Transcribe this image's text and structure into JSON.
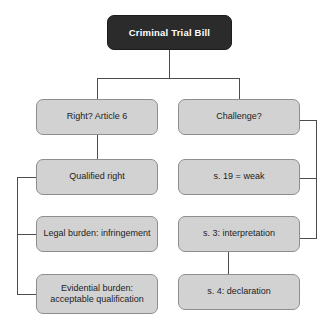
{
  "diagram": {
    "title": "Criminal Trial Bill",
    "type": "flowchart",
    "orientation": "top-down",
    "colors": {
      "root_fill": "#2b2b2b",
      "root_text": "#ffffff",
      "node_fill": "#d2d2d2",
      "node_border": "#8e8e8e",
      "node_text": "#1d1d1d",
      "connector": "#4d4d4d",
      "background": "#ffffff"
    },
    "nodes": {
      "root": {
        "label": "Criminal Trial Bill"
      },
      "left_1": {
        "label": "Right? Article 6"
      },
      "left_2": {
        "label": "Qualified right"
      },
      "left_3": {
        "label": "Legal burden: infringement"
      },
      "left_4_line1": {
        "label": "Evidential burden:"
      },
      "left_4_line2": {
        "label": "acceptable qualification"
      },
      "right_1": {
        "label": "Challenge?"
      },
      "right_2": {
        "label": "s. 19 = weak"
      },
      "right_3": {
        "label": "s. 3: interpretation"
      },
      "right_4": {
        "label": "s. 4: declaration"
      }
    }
  }
}
